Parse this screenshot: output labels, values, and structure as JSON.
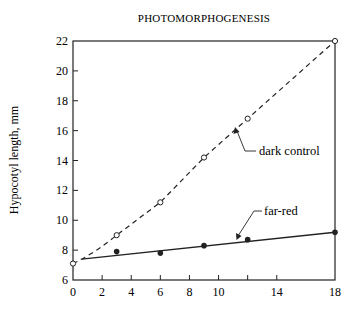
{
  "chart_data": {
    "type": "line",
    "title": "PHOTOMORPHOGENESIS",
    "xlabel": "",
    "ylabel": "Hypocotyl length, mm",
    "xlim": [
      0,
      18
    ],
    "ylim": [
      6,
      22
    ],
    "x_ticks": [
      0,
      2,
      4,
      6,
      8,
      10,
      12,
      14,
      18
    ],
    "x_tick_labels": [
      "0",
      "2",
      "4",
      "6",
      "8",
      "10",
      "",
      "14",
      "18"
    ],
    "y_ticks": [
      6,
      8,
      10,
      12,
      14,
      16,
      18,
      20,
      22
    ],
    "y_tick_labels": [
      "6",
      "8",
      "10",
      "12",
      "14",
      "16",
      "18",
      "20",
      "22"
    ],
    "grid": false,
    "legend": "inline annotations",
    "series": [
      {
        "name": "dark control",
        "style": "dashed",
        "marker": "open-circle",
        "x": [
          0,
          3,
          6,
          9,
          12,
          18
        ],
        "values": [
          7.1,
          9.0,
          11.2,
          14.2,
          16.8,
          22.0
        ]
      },
      {
        "name": "far-red",
        "style": "solid",
        "marker": "filled-circle",
        "x": [
          3,
          6,
          9,
          12,
          18
        ],
        "values": [
          7.9,
          7.8,
          8.3,
          8.7,
          9.2
        ],
        "fit_line": {
          "x": [
            0.6,
            18
          ],
          "y": [
            7.4,
            9.2
          ]
        }
      }
    ],
    "annotations": [
      {
        "text": "dark control",
        "points_to_series": "dark control"
      },
      {
        "text": "far-red",
        "points_to_series": "far-red"
      }
    ]
  }
}
